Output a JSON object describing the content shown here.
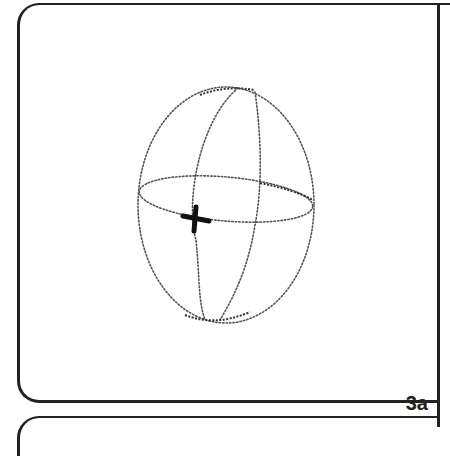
{
  "panel": {
    "label": "3a",
    "border_color": "#222222",
    "background": "#ffffff"
  },
  "figure": {
    "ellipsoid": {
      "center": [
        226,
        205
      ],
      "radius_x": 88,
      "radius_y": 118,
      "stroke": "dotted"
    },
    "equator": {
      "center": [
        226,
        199
      ],
      "radius_x": 87,
      "radius_y": 22,
      "rotation_deg": 5
    },
    "meridians": 2,
    "marker": {
      "shape": "cross",
      "position": [
        196,
        219
      ],
      "color": "#111111"
    }
  }
}
